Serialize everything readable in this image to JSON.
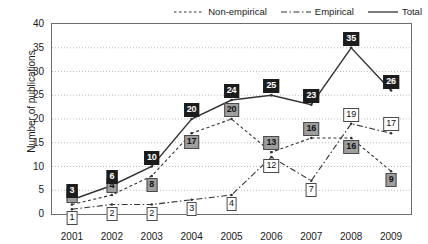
{
  "chart_data": {
    "type": "line",
    "title": "",
    "xlabel": "",
    "ylabel": "Number of publications",
    "categories": [
      "2001",
      "2002",
      "2003",
      "2004",
      "2005",
      "2006",
      "2007",
      "2008",
      "2009"
    ],
    "ylim": [
      0,
      40
    ],
    "ytick_values": [
      0,
      5,
      10,
      15,
      20,
      25,
      30,
      35,
      40
    ],
    "ytick_labels": [
      "0",
      "5",
      "10",
      "15",
      "20",
      "25",
      "30",
      "35",
      "40"
    ],
    "grid": "horizontal-dotted",
    "legend_position": "top-right",
    "series": [
      {
        "name": "Non-empirical",
        "style": "dashed",
        "marker_label_style": "gray-box",
        "values": [
          2,
          4,
          8,
          17,
          20,
          13,
          16,
          16,
          9
        ]
      },
      {
        "name": "Empirical",
        "style": "dash-dot",
        "marker_label_style": "white-box",
        "values": [
          1,
          2,
          2,
          3,
          4,
          12,
          7,
          19,
          17
        ]
      },
      {
        "name": "Total",
        "style": "solid",
        "marker_label_style": "black-box",
        "values": [
          3,
          6,
          10,
          20,
          24,
          25,
          23,
          35,
          26
        ]
      }
    ]
  },
  "legend": {
    "items": [
      {
        "label": "Non-empirical",
        "icon": "dashed-line-icon"
      },
      {
        "label": "Empirical",
        "icon": "dash-dot-line-icon"
      },
      {
        "label": "Total",
        "icon": "solid-line-icon"
      }
    ]
  },
  "colors": {
    "axis": "#6e6e6e",
    "grid": "#bdbdbd",
    "line": "#333333",
    "total_label_bg": "#1c1c1c",
    "nonempirical_label_bg": "#9e9e9e",
    "empirical_label_bg": "#ffffff",
    "text": "#1a1a1a"
  }
}
